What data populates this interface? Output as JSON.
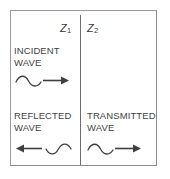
{
  "figure": {
    "background_color": "#ffffff",
    "line_color": "#3f3f3f",
    "frame_color": "#8a8a8a",
    "divider_color": "#6d6d6d"
  },
  "media": {
    "left": {
      "symbol": "Z",
      "subscript": "1"
    },
    "right": {
      "symbol": "Z",
      "subscript": "2"
    }
  },
  "waves": {
    "incident": {
      "line1": "INCIDENT",
      "line2": "WAVE",
      "direction": "right",
      "glyph_order": "squiggle-then-arrow"
    },
    "reflected": {
      "line1": "REFLECTED",
      "line2": "WAVE",
      "direction": "left",
      "glyph_order": "arrow-then-squiggle"
    },
    "transmitted": {
      "line1": "TRANSMITTED",
      "line2": "WAVE",
      "direction": "right",
      "glyph_order": "squiggle-then-arrow"
    }
  }
}
